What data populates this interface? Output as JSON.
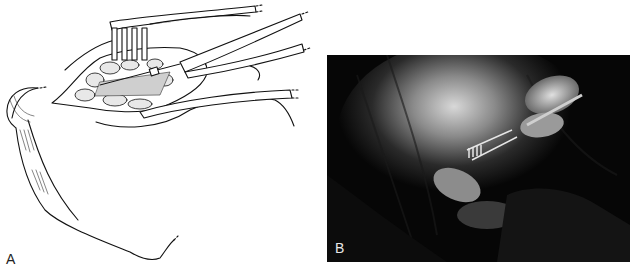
{
  "figure": {
    "panels": [
      {
        "id": "A",
        "label": "A",
        "type": "line-drawing",
        "description": "Surgical illustration: retractor and clamp in an incision"
      },
      {
        "id": "B",
        "label": "B",
        "type": "photograph",
        "description": "Intraoperative photo: gloved hands holding retractor and instrument"
      }
    ],
    "colors": {
      "background": "#ffffff",
      "ink": "#111111",
      "photo_dark": "#060606"
    }
  }
}
